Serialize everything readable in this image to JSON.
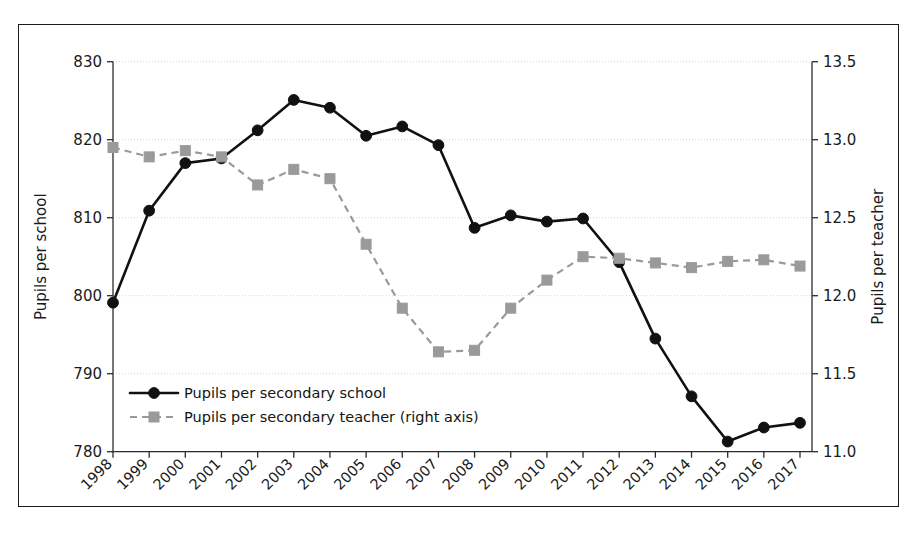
{
  "chart_data": {
    "type": "line",
    "title": "",
    "xlabel": "",
    "ylabel": "Pupils per school",
    "y2label": "Pupils per teacher",
    "grid": true,
    "legend_position": "lower-left-inside",
    "x": [
      "1998",
      "1999",
      "2000",
      "2001",
      "2002",
      "2003",
      "2004",
      "2005",
      "2006",
      "2007",
      "2008",
      "2009",
      "2010",
      "2011",
      "2012",
      "2013",
      "2014",
      "2015",
      "2016",
      "2017"
    ],
    "ylim": [
      780,
      830
    ],
    "yticks": [
      "780",
      "790",
      "800",
      "810",
      "820",
      "830"
    ],
    "y2lim": [
      11.0,
      13.5
    ],
    "y2ticks": [
      "11.0",
      "11.5",
      "12.0",
      "12.5",
      "13.0",
      "13.5"
    ],
    "series": [
      {
        "name": "Pupils per secondary school",
        "axis": "left",
        "marker": "circle",
        "linestyle": "solid",
        "color": "#111111",
        "values": [
          799.1,
          810.9,
          817.0,
          817.6,
          821.2,
          825.1,
          824.1,
          820.5,
          821.7,
          819.3,
          808.7,
          810.3,
          809.5,
          809.9,
          804.3,
          794.5,
          787.1,
          781.3,
          783.1,
          783.7
        ]
      },
      {
        "name": "Pupils per secondary teacher (right axis)",
        "axis": "right",
        "marker": "square",
        "linestyle": "dashed",
        "color": "#9a9a9a",
        "values": [
          12.95,
          12.89,
          12.93,
          12.89,
          12.71,
          12.81,
          12.75,
          12.33,
          11.92,
          11.64,
          11.65,
          11.92,
          12.1,
          12.25,
          12.24,
          12.21,
          12.18,
          12.22,
          12.23,
          12.19
        ]
      }
    ]
  },
  "axes": {
    "left_title": "Pupils per school",
    "right_title": "Pupils per teacher"
  },
  "legend": {
    "items": [
      {
        "label": "Pupils per secondary school"
      },
      {
        "label": "Pupils per secondary teacher (right axis)"
      }
    ]
  },
  "colors": {
    "series_school": "#111111",
    "series_teacher": "#9a9a9a",
    "grid": "#cfcfcf",
    "axis": "#2b2b2b",
    "frame": "#1a1a1a",
    "background": "#ffffff"
  }
}
